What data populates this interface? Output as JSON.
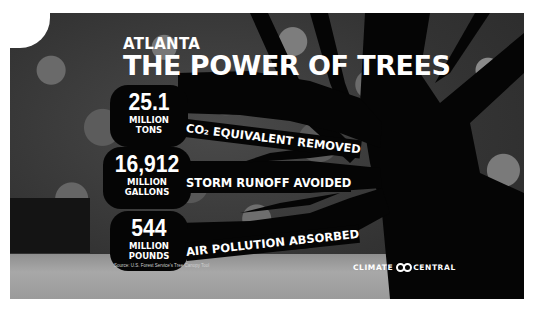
{
  "header": {
    "city": "ATLANTA",
    "title": "THE POWER OF TREES"
  },
  "stats": [
    {
      "value": "25.1",
      "unit_line1": "MILLION",
      "unit_line2": "TONS",
      "label": "CO₂ EQUIVALENT REMOVED"
    },
    {
      "value": "16,912",
      "unit_line1": "MILLION",
      "unit_line2": "GALLONS",
      "label": "STORM RUNOFF AVOIDED"
    },
    {
      "value": "544",
      "unit_line1": "MILLION",
      "unit_line2": "POUNDS",
      "label": "AIR POLLUTION ABSORBED"
    }
  ],
  "footer": {
    "source": "Source: U.S. Forest Service's Tree Canopy Tool",
    "brand_left": "CLIMATE",
    "brand_right": "CENTRAL"
  },
  "colors": {
    "background": "#1a1a1a",
    "text": "#ffffff",
    "badge": "#050505",
    "ground": "#9a9a9a"
  }
}
